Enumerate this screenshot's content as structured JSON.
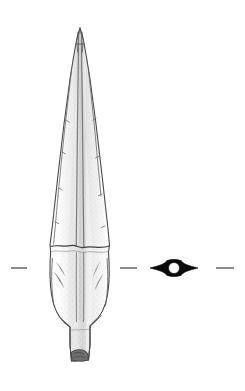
{
  "plate": {
    "width": 245,
    "height": 391,
    "background_color": "#ffffff",
    "ink_color": "#3a3a3a",
    "outline_color": "#4a4a4a",
    "section_fill_color": "#0a0a0a",
    "tick_color": "#8c8c8c",
    "stipple_color": "#6b6b6b",
    "caption": ""
  },
  "figure": {
    "object_type": "socketed spearhead",
    "view_label": "profile view",
    "section_label": "cross-section",
    "parts": [
      {
        "name": "tip",
        "label": "Point tip"
      },
      {
        "name": "blade",
        "label": "Blade"
      },
      {
        "name": "midrib",
        "label": "Midrib"
      },
      {
        "name": "socket",
        "label": "Socket"
      },
      {
        "name": "tang",
        "label": "Tang / shaft stub"
      }
    ]
  },
  "section_diagram": {
    "label": "Lenticular cross-section with hollow socket",
    "shape": "lens",
    "bore": "circular",
    "center_x": 174,
    "center_y": 268,
    "half_width": 24,
    "half_height": 7,
    "bore_radius": 5.5
  },
  "alignment_ticks": [
    {
      "name": "tick-left",
      "x1": 11,
      "x2": 27,
      "y": 268
    },
    {
      "name": "tick-center",
      "x1": 120,
      "x2": 137,
      "y": 268
    },
    {
      "name": "tick-right",
      "x1": 216,
      "x2": 234,
      "y": 268
    }
  ],
  "geometry": {
    "axis_x": 80,
    "tip_y": 28,
    "base_y": 363,
    "break_y": 245,
    "blade_max_half_width": 30
  }
}
